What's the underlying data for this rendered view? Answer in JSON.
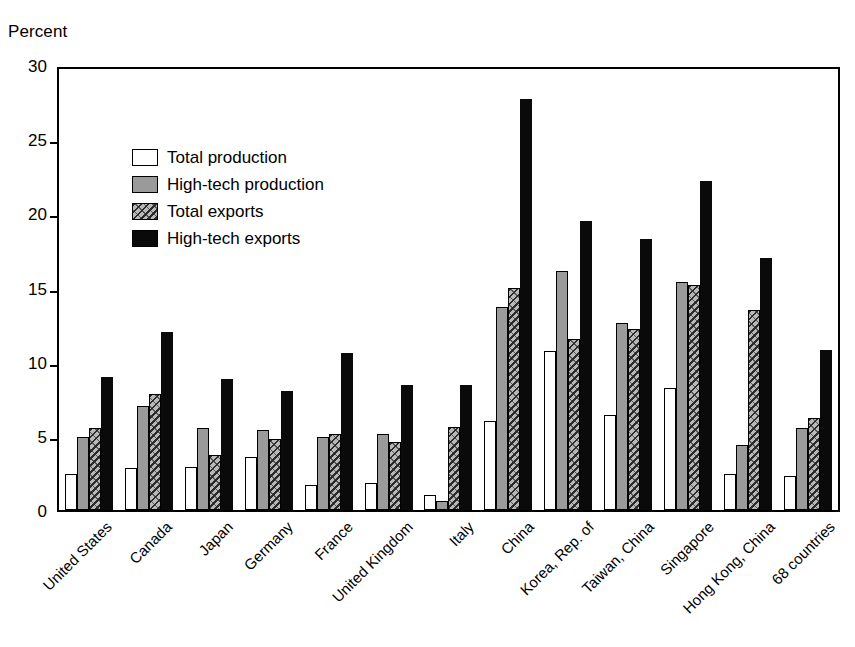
{
  "axis": {
    "ylabel": "Percent",
    "yticks": [
      0,
      5,
      10,
      15,
      20,
      25,
      30
    ],
    "ymin": 0,
    "ymax": 30
  },
  "legend": {
    "position": "top-left-inside",
    "items": [
      {
        "label": "Total production",
        "fill": "#ffffff",
        "pattern": "solid-white"
      },
      {
        "label": "High-tech production",
        "fill": "#9a9a9a",
        "pattern": "solid-gray"
      },
      {
        "label": "Total exports",
        "fill": "#b8b8b8",
        "pattern": "speckled-hatch"
      },
      {
        "label": "High-tech exports",
        "fill": "#0a0a0a",
        "pattern": "solid-black"
      }
    ]
  },
  "chart_data": {
    "type": "bar",
    "title": "",
    "subtitle": "",
    "xlabel": "",
    "ylabel": "Percent",
    "ylim": [
      0,
      30
    ],
    "yticks": [
      0,
      5,
      10,
      15,
      20,
      25,
      30
    ],
    "grid": false,
    "legend_position": "upper left (inside plot)",
    "categories": [
      "United States",
      "Canada",
      "Japan",
      "Germany",
      "France",
      "United Kingdom",
      "Italy",
      "China",
      "Korea, Rep. of",
      "Taiwan, China",
      "Singapore",
      "Hong Kong, China",
      "68 countries"
    ],
    "series": [
      {
        "name": "Total production",
        "color": "#ffffff",
        "values": [
          2.4,
          2.8,
          2.9,
          3.6,
          1.7,
          1.8,
          1.0,
          6.0,
          10.7,
          6.4,
          8.2,
          2.4,
          2.3
        ]
      },
      {
        "name": "High-tech production",
        "color": "#9a9a9a",
        "values": [
          4.9,
          7.0,
          5.5,
          5.4,
          4.9,
          5.1,
          0.6,
          13.7,
          16.1,
          12.6,
          15.4,
          4.4,
          5.5
        ]
      },
      {
        "name": "Total exports",
        "color": "#b8b8b8",
        "values": [
          5.5,
          7.8,
          3.7,
          4.8,
          5.1,
          4.6,
          5.6,
          15.0,
          11.5,
          12.2,
          15.2,
          13.5,
          6.2
        ]
      },
      {
        "name": "High-tech exports",
        "color": "#0a0a0a",
        "values": [
          9.0,
          12.0,
          8.8,
          8.0,
          10.6,
          8.4,
          8.4,
          27.7,
          19.5,
          18.3,
          22.2,
          17.0,
          10.8
        ]
      }
    ]
  }
}
